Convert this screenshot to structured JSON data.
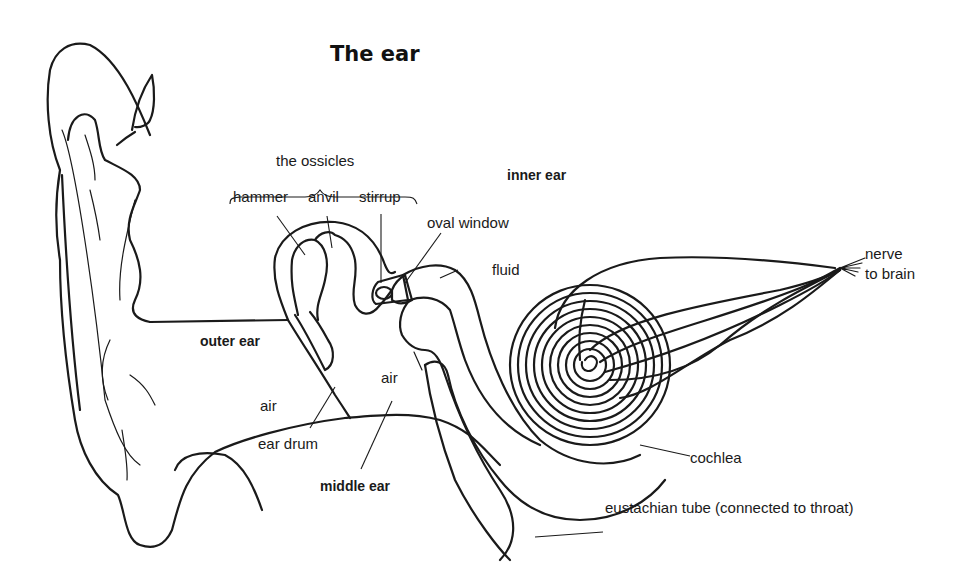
{
  "title": "The ear",
  "regions": {
    "outer_ear": "outer ear",
    "middle_ear": "middle ear",
    "inner_ear": "inner ear"
  },
  "group_labels": {
    "ossicles": "the ossicles"
  },
  "labels": {
    "hammer": "hammer",
    "anvil": "anvil",
    "stirrup": "stirrup",
    "oval_window": "oval window",
    "fluid": "fluid",
    "nerve_line1": "nerve",
    "nerve_line2": "to brain",
    "air_outer": "air",
    "air_middle": "air",
    "ear_drum": "ear drum",
    "cochlea": "cochlea",
    "eustachian_tube": "eustachian tube (connected to throat)"
  },
  "colors": {
    "line": "#1a1a1a",
    "background": "#ffffff"
  }
}
